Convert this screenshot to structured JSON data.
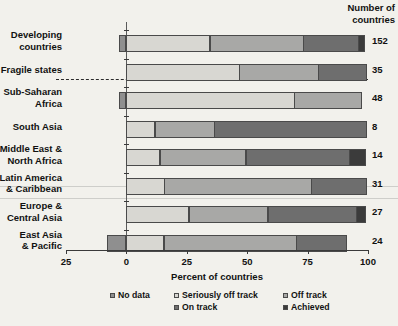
{
  "header": {
    "right_column_title_line1": "Number of",
    "right_column_title_line2": "countries"
  },
  "axis": {
    "x_title": "Percent of countries",
    "x_ticks": [
      "25",
      "0",
      "25",
      "50",
      "75",
      "100"
    ],
    "x_tick_values": [
      -25,
      0,
      25,
      50,
      75,
      100
    ],
    "x_min": -25,
    "x_max": 100
  },
  "legend": {
    "items": [
      {
        "label": "No data",
        "color": "#8f8f8f"
      },
      {
        "label": "Seriously off track",
        "color": "#d8d7d2"
      },
      {
        "label": "Off track",
        "color": "#a8a8a6"
      },
      {
        "label": "On track",
        "color": "#6e6e6e"
      },
      {
        "label": "Achieved",
        "color": "#3b3b3b"
      }
    ]
  },
  "categories": [
    {
      "line1": "Developing",
      "line2": "countries",
      "count": "152"
    },
    {
      "line1": "Fragile states",
      "line2": "",
      "count": "35"
    },
    {
      "line1": "Sub-Saharan",
      "line2": "Africa",
      "count": "48"
    },
    {
      "line1": "South Asia",
      "line2": "",
      "count": "8"
    },
    {
      "line1": "Middle East &",
      "line2": "North Africa",
      "count": "14"
    },
    {
      "line1": "Latin America",
      "line2": "& Caribbean",
      "count": "31"
    },
    {
      "line1": "Europe &",
      "line2": "Central Asia",
      "count": "27"
    },
    {
      "line1": "East Asia",
      "line2": "& Pacific",
      "count": "24"
    }
  ],
  "chart_data": {
    "type": "bar",
    "orientation": "horizontal",
    "stacked": true,
    "title": "",
    "xlabel": "Percent of countries",
    "ylabel": "",
    "xlim": [
      -25,
      100
    ],
    "grid": false,
    "legend_position": "bottom",
    "categories": [
      "Developing countries",
      "Fragile states",
      "Sub-Saharan Africa",
      "South Asia",
      "Middle East & North Africa",
      "Latin America & Caribbean",
      "Europe & Central Asia",
      "East Asia & Pacific"
    ],
    "series": [
      {
        "name": "No data",
        "color": "#8f8f8f",
        "values": [
          -3,
          0,
          -3,
          0,
          0,
          0,
          0,
          -8
        ]
      },
      {
        "name": "Seriously off track",
        "color": "#d8d7d2",
        "values": [
          35,
          47,
          70,
          12,
          14,
          16,
          26,
          16
        ]
      },
      {
        "name": "Off track",
        "color": "#a8a8a6",
        "values": [
          39,
          33,
          28,
          25,
          36,
          61,
          33,
          55
        ]
      },
      {
        "name": "On track",
        "color": "#6e6e6e",
        "values": [
          23,
          20,
          0,
          63,
          43,
          23,
          37,
          21
        ]
      },
      {
        "name": "Achieved",
        "color": "#3b3b3b",
        "values": [
          3,
          0,
          0,
          0,
          7,
          0,
          4,
          0
        ]
      }
    ],
    "right_axis_label": "Number of countries",
    "right_axis_values": [
      152,
      35,
      48,
      8,
      14,
      31,
      27,
      24
    ],
    "annotations": [
      {
        "type": "dashed-separator",
        "after_category": "Fragile states"
      }
    ]
  }
}
